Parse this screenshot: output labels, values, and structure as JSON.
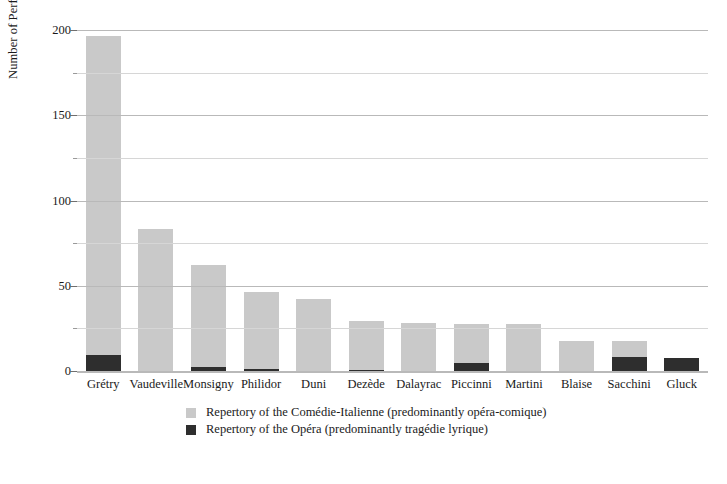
{
  "chart_data": {
    "type": "bar",
    "stacked": true,
    "title": "",
    "xlabel": "",
    "ylabel": "Number of Performances",
    "ylim": [
      0,
      200
    ],
    "yticks": [
      0,
      50,
      100,
      150,
      200
    ],
    "yticklabels": [
      "0",
      "50",
      "100",
      "150",
      "200"
    ],
    "yminorticks": [
      25,
      75,
      125,
      175
    ],
    "grid": true,
    "legend_position": "bottom-center",
    "categories": [
      "Grétry",
      "Vaudeville",
      "Monsigny",
      "Philidor",
      "Duni",
      "Dezède",
      "Dalayrac",
      "Piccinni",
      "Martini",
      "Blaise",
      "Sacchini",
      "Gluck"
    ],
    "series": [
      {
        "name": "Repertory of the Comédie-Italienne (predominantly opéra-comique)",
        "color": "#c9c9c9",
        "values": [
          187,
          84,
          60,
          45,
          43,
          29,
          29,
          23,
          28,
          18,
          9,
          0
        ]
      },
      {
        "name": "Repertory of the Opéra (predominantly tragédie lyrique)",
        "color": "#2e2e2e",
        "values": [
          10,
          0,
          3,
          2,
          0,
          1,
          0,
          5,
          0,
          0,
          9,
          8
        ]
      }
    ],
    "totals": [
      197,
      84,
      63,
      47,
      43,
      30,
      29,
      28,
      28,
      18,
      18,
      8
    ]
  },
  "legend": {
    "entries": [
      {
        "label": "Repertory of the Comédie-Italienne (predominantly opéra-comique)",
        "color": "#c9c9c9"
      },
      {
        "label": "Repertory of the Opéra (predominantly tragédie lyrique)",
        "color": "#2e2e2e"
      }
    ]
  }
}
